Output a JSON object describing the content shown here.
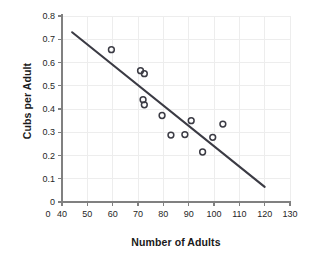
{
  "chart_data": {
    "type": "scatter",
    "title": "",
    "xlabel": "Number of Adults",
    "ylabel": "Cubs per Adult",
    "xlim": [
      40,
      130
    ],
    "ylim": [
      0,
      0.8
    ],
    "grid": true,
    "legend": "none",
    "x_ticks": [
      "0",
      "40",
      "50",
      "60",
      "70",
      "80",
      "90",
      "100",
      "110",
      "120",
      "130"
    ],
    "x_tick_values": [
      0,
      40,
      50,
      60,
      70,
      80,
      90,
      100,
      110,
      120,
      130
    ],
    "x_axis_break": true,
    "y_ticks": [
      "0",
      "0.1",
      "0.2",
      "0.3",
      "0.4",
      "0.5",
      "0.6",
      "0.7",
      "0.8"
    ],
    "y_tick_values": [
      0,
      0.1,
      0.2,
      0.3,
      0.4,
      0.5,
      0.6,
      0.7,
      0.8
    ],
    "marker": "open-circle",
    "marker_color": "#3b3b44",
    "line_color": "#3b3b44",
    "grid_color": "#ededed",
    "axis_color": "#808080",
    "points": [
      {
        "x": 59.5,
        "y": 0.655
      },
      {
        "x": 71.0,
        "y": 0.565
      },
      {
        "x": 72.5,
        "y": 0.552
      },
      {
        "x": 72.0,
        "y": 0.44
      },
      {
        "x": 72.5,
        "y": 0.418
      },
      {
        "x": 79.5,
        "y": 0.372
      },
      {
        "x": 83.0,
        "y": 0.288
      },
      {
        "x": 88.5,
        "y": 0.29
      },
      {
        "x": 91.0,
        "y": 0.35
      },
      {
        "x": 95.5,
        "y": 0.215
      },
      {
        "x": 99.5,
        "y": 0.278
      },
      {
        "x": 103.5,
        "y": 0.335
      }
    ],
    "trend_line": {
      "name": "line of best fit",
      "x1": 44,
      "y1": 0.73,
      "x2": 120,
      "y2": 0.065
    }
  }
}
